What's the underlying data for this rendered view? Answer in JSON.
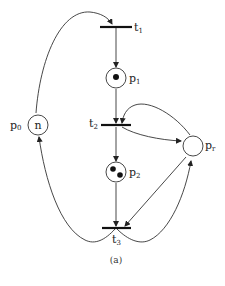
{
  "diagram": {
    "type": "petri-net",
    "caption": "(a)",
    "places": [
      {
        "id": "p0",
        "label": "p",
        "sub": "0",
        "tokens": "n"
      },
      {
        "id": "p1",
        "label": "p",
        "sub": "1",
        "tokens": 1
      },
      {
        "id": "p2",
        "label": "p",
        "sub": "2",
        "tokens": 2
      },
      {
        "id": "pr",
        "label": "p",
        "sub": "r",
        "tokens": 0
      }
    ],
    "transitions": [
      {
        "id": "t1",
        "label": "t",
        "sub": "1"
      },
      {
        "id": "t2",
        "label": "t",
        "sub": "2"
      },
      {
        "id": "t3",
        "label": "t",
        "sub": "3"
      }
    ],
    "arcs": [
      {
        "from": "p0",
        "to": "t1"
      },
      {
        "from": "t1",
        "to": "p1"
      },
      {
        "from": "p1",
        "to": "t2"
      },
      {
        "from": "pr",
        "to": "t2"
      },
      {
        "from": "t2",
        "to": "pr"
      },
      {
        "from": "t2",
        "to": "p2"
      },
      {
        "from": "p2",
        "to": "t3"
      },
      {
        "from": "pr",
        "to": "t3"
      },
      {
        "from": "t3",
        "to": "pr"
      },
      {
        "from": "t3",
        "to": "p0"
      }
    ],
    "colors": {
      "stroke": "#222222",
      "background": "#ffffff"
    }
  }
}
